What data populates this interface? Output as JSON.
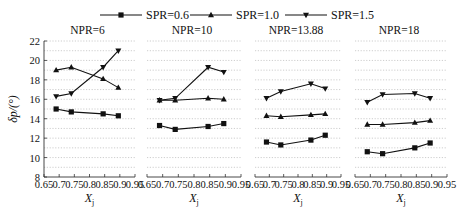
{
  "chart_data": {
    "type": "line",
    "legend": {
      "position": "top",
      "entries": [
        {
          "label": "SPR=0.6",
          "marker": "square"
        },
        {
          "label": "SPR=1.0",
          "marker": "triangle-up"
        },
        {
          "label": "SPR=1.5",
          "marker": "triangle-down"
        }
      ]
    },
    "ylabel": "δp/(°)",
    "xlabel": "Xj",
    "ylim": [
      8,
      22
    ],
    "yticks": [
      8,
      10,
      12,
      14,
      16,
      18,
      20,
      22
    ],
    "xlim": [
      0.65,
      0.95
    ],
    "xticks": [
      "0.65",
      "0.7",
      "0.75",
      "0.8",
      "0.85",
      "0.9",
      "0.95"
    ],
    "grid": "horizontal dotted",
    "panels": [
      {
        "title": "NPR=6",
        "x": [
          0.69,
          0.74,
          0.845,
          0.895
        ],
        "series": [
          {
            "name": "SPR=0.6",
            "values": [
              15.0,
              14.7,
              14.5,
              14.3
            ]
          },
          {
            "name": "SPR=1.0",
            "values": [
              19.0,
              19.3,
              18.1,
              17.2
            ]
          },
          {
            "name": "SPR=1.5",
            "values": [
              16.3,
              16.6,
              19.3,
              21.0
            ]
          }
        ]
      },
      {
        "title": "NPR=10",
        "x": [
          0.69,
          0.74,
          0.845,
          0.895
        ],
        "series": [
          {
            "name": "SPR=0.6",
            "values": [
              13.3,
              12.9,
              13.2,
              13.5
            ]
          },
          {
            "name": "SPR=1.0",
            "values": [
              15.9,
              15.9,
              16.1,
              16.0
            ]
          },
          {
            "name": "SPR=1.5",
            "values": [
              15.9,
              16.1,
              19.3,
              18.8
            ]
          }
        ]
      },
      {
        "title": "NPR=13.88",
        "x": [
          0.69,
          0.74,
          0.845,
          0.895
        ],
        "series": [
          {
            "name": "SPR=0.6",
            "values": [
              11.6,
              11.3,
              11.8,
              12.3
            ]
          },
          {
            "name": "SPR=1.0",
            "values": [
              14.3,
              14.2,
              14.4,
              14.5
            ]
          },
          {
            "name": "SPR=1.5",
            "values": [
              16.1,
              16.8,
              17.6,
              17.1
            ]
          }
        ]
      },
      {
        "title": "NPR=18",
        "x": [
          0.69,
          0.74,
          0.845,
          0.895
        ],
        "series": [
          {
            "name": "SPR=0.6",
            "values": [
              10.6,
              10.4,
              11.0,
              11.5
            ]
          },
          {
            "name": "SPR=1.0",
            "values": [
              13.4,
              13.4,
              13.6,
              13.8
            ]
          },
          {
            "name": "SPR=1.5",
            "values": [
              15.7,
              16.5,
              16.6,
              16.1
            ]
          }
        ]
      }
    ]
  },
  "colors": {
    "line": "#111111",
    "grid": "#b8b8b8",
    "axis": "#333333"
  }
}
